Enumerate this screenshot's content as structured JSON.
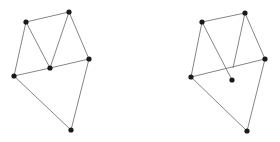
{
  "diagram": {
    "type": "graph-comparison",
    "edge_color": "#666666",
    "node_color": "#1a1a1a",
    "graphs": [
      {
        "name": "left-graph",
        "nodes": [
          {
            "id": "A",
            "x": 26,
            "y": 22
          },
          {
            "id": "B",
            "x": 69,
            "y": 12
          },
          {
            "id": "C",
            "x": 89,
            "y": 59
          },
          {
            "id": "D",
            "x": 50,
            "y": 68
          },
          {
            "id": "E",
            "x": 14,
            "y": 76
          },
          {
            "id": "F",
            "x": 71,
            "y": 130
          }
        ],
        "edges": [
          [
            "A",
            "B"
          ],
          [
            "A",
            "D"
          ],
          [
            "A",
            "E"
          ],
          [
            "B",
            "D"
          ],
          [
            "B",
            "C"
          ],
          [
            "D",
            "C"
          ],
          [
            "E",
            "D"
          ],
          [
            "E",
            "F"
          ],
          [
            "C",
            "F"
          ]
        ]
      },
      {
        "name": "right-graph",
        "nodes": [
          {
            "id": "A",
            "x": 202,
            "y": 22
          },
          {
            "id": "B",
            "x": 245,
            "y": 13
          },
          {
            "id": "C",
            "x": 265,
            "y": 59
          },
          {
            "id": "D",
            "x": 232,
            "y": 80
          },
          {
            "id": "E",
            "x": 191,
            "y": 77
          },
          {
            "id": "F",
            "x": 247,
            "y": 131
          }
        ],
        "segments": [
          [
            202,
            22,
            245,
            13
          ],
          [
            202,
            22,
            232,
            80
          ],
          [
            202,
            22,
            191,
            77
          ],
          [
            245,
            13,
            265,
            59
          ],
          [
            245,
            13,
            233,
            68
          ],
          [
            191,
            77,
            265,
            59
          ],
          [
            191,
            77,
            247,
            131
          ],
          [
            265,
            59,
            247,
            131
          ]
        ]
      }
    ]
  }
}
